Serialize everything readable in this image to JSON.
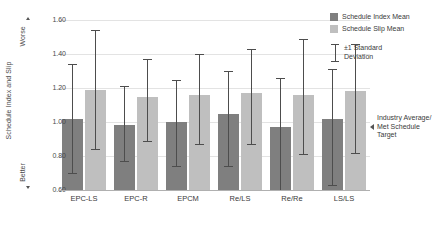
{
  "chart_data": {
    "type": "bar",
    "title": "",
    "xlabel": "",
    "ylabel": "Schedule Index and Slip",
    "ylim": [
      0.6,
      1.6
    ],
    "ytick_step": 0.2,
    "yticks": [
      "1.60",
      "1.40",
      "1.20",
      "1.00",
      "0.80",
      "0.60"
    ],
    "ytick_values": [
      1.6,
      1.4,
      1.2,
      1.0,
      0.8,
      0.6
    ],
    "grid": true,
    "legend_position": "right-top",
    "categories": [
      "EPC-LS",
      "EPC-R",
      "EPCM",
      "Re/LS",
      "Re/Re",
      "LS/LS"
    ],
    "series": [
      {
        "name": "Schedule Index Mean",
        "color": "#7f7f7f",
        "values": [
          1.02,
          0.98,
          1.0,
          1.05,
          0.97,
          1.02
        ],
        "err_low": [
          0.7,
          0.77,
          0.74,
          0.74,
          0.6,
          0.63
        ],
        "err_high": [
          1.34,
          1.21,
          1.25,
          1.3,
          1.26,
          1.31
        ]
      },
      {
        "name": "Schedule Slip Mean",
        "color": "#bfbfbf",
        "values": [
          1.19,
          1.15,
          1.16,
          1.17,
          1.16,
          1.18
        ],
        "err_low": [
          0.84,
          0.89,
          0.87,
          0.87,
          0.81,
          0.82
        ],
        "err_high": [
          1.54,
          1.37,
          1.4,
          1.43,
          1.49,
          1.46
        ]
      }
    ],
    "error_legend": "±1 Standard\nDeviation",
    "annotations": [
      {
        "name": "industry-average-marker",
        "text": "Industry Average/\nMet Schedule Target",
        "y_value": 1.0,
        "arrow": "left"
      },
      {
        "name": "worse-direction",
        "text": "Worse",
        "arrow": "up"
      },
      {
        "name": "better-direction",
        "text": "Better",
        "arrow": "down"
      }
    ]
  },
  "axis": {
    "y_title": "Schedule Index and Slip",
    "worse": "Worse",
    "better": "Better"
  },
  "legend": {
    "index_label": "Schedule Index Mean",
    "slip_label": "Schedule Slip Mean",
    "sd_label": "±1 Standard\nDeviation"
  },
  "annotation": {
    "industry": "Industry Average/\nMet Schedule Target"
  }
}
